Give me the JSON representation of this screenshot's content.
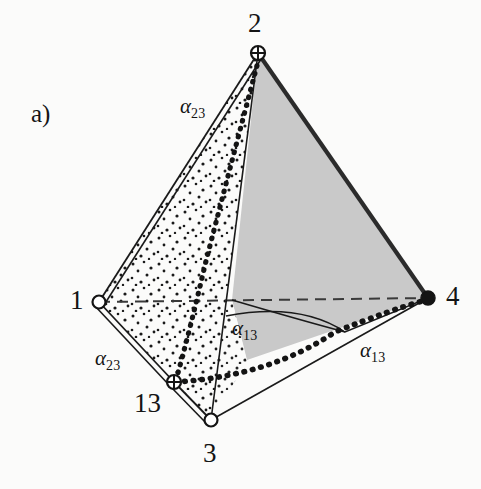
{
  "figure": {
    "panel_label": "a)",
    "caption_kind": "tetrahedron-diagram",
    "background_color": "#fbfbfa",
    "ink_color": "#141414",
    "shaded_face_color": "#c9c9c9",
    "stipple_color": "#1a1a1a",
    "vertices": [
      {
        "id": "v1",
        "label": "1",
        "marker": "open-circle",
        "x": 99,
        "y": 302,
        "label_x": 70,
        "label_y": 287
      },
      {
        "id": "v2",
        "label": "2",
        "marker": "crossed-circle",
        "x": 258,
        "y": 53,
        "label_x": 248,
        "label_y": 10
      },
      {
        "id": "v3",
        "label": "3",
        "marker": "open-circle",
        "x": 211,
        "y": 420,
        "label_x": 203,
        "label_y": 440
      },
      {
        "id": "v4",
        "label": "4",
        "marker": "filled-circle",
        "x": 428,
        "y": 298,
        "label_x": 446,
        "label_y": 283
      },
      {
        "id": "v13",
        "label": "13",
        "marker": "crossed-circle",
        "x": 174,
        "y": 382,
        "label_x": 134,
        "label_y": 390
      }
    ],
    "angle_labels": [
      {
        "id": "a23-upper",
        "text": "α",
        "sub": "23",
        "x": 180,
        "y": 96
      },
      {
        "id": "a23-lower",
        "text": "α",
        "sub": "23",
        "x": 95,
        "y": 348
      },
      {
        "id": "a13-inner",
        "text": "α",
        "sub": "13",
        "x": 232,
        "y": 318
      },
      {
        "id": "a13-outer",
        "text": "α",
        "sub": "13",
        "x": 360,
        "y": 340
      }
    ],
    "edges": [
      {
        "id": "e-1-2",
        "from": "v1",
        "to": "v2",
        "style": "double-solid"
      },
      {
        "id": "e-2-4",
        "from": "v2",
        "to": "v4",
        "style": "thick-solid"
      },
      {
        "id": "e-1-4",
        "from": "v1",
        "to": "v4",
        "style": "dashed-hidden"
      },
      {
        "id": "e-1-13",
        "from": "v1",
        "to": "v13",
        "style": "double-solid"
      },
      {
        "id": "e-13-3",
        "from": "v13",
        "to": "v3",
        "style": "double-solid"
      },
      {
        "id": "e-3-4",
        "from": "v3",
        "to": "v4",
        "style": "thin-solid"
      },
      {
        "id": "e-2-3",
        "from": "v2",
        "to": "v3",
        "style": "thin-solid"
      }
    ],
    "curves": [
      {
        "id": "curve-2-13-4",
        "style": "thick-dotted",
        "note": "geodesic from vertex 2 through 13 to edge 3-4"
      },
      {
        "id": "arc-13-inner",
        "style": "thin-solid",
        "note": "arc bounding alpha-13 inner angle"
      },
      {
        "id": "arc-4-lower",
        "style": "thin-solid",
        "note": "arc from interior toward vertex 4"
      }
    ],
    "faces": [
      {
        "id": "face-1-2-13-3",
        "fill": "stipple",
        "note": "left face, randomly stippled"
      },
      {
        "id": "face-2-4",
        "fill": "solid-gray",
        "note": "right face shaded light gray"
      }
    ]
  }
}
